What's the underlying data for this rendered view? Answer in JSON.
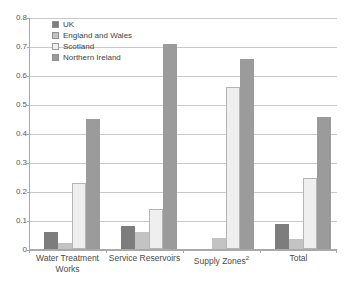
{
  "chart_data": {
    "type": "bar",
    "title": "",
    "subtitle": "",
    "xlabel": "",
    "ylabel": "",
    "ylim": [
      0,
      0.8
    ],
    "ytick_step": 0.1,
    "ytick_labels": [
      "0.8",
      "0.7",
      "0.6",
      "0.5",
      "0.4",
      "0.3",
      "0.2",
      "0.1",
      "0"
    ],
    "ytick_values": [
      0.8,
      0.7,
      0.6,
      0.5,
      0.4,
      0.3,
      0.2,
      0.1,
      0
    ],
    "grid": true,
    "grid_axis": "y",
    "legend_position": "top-left-inside",
    "categories": [
      "Water Treatment Works",
      "Service Reservoirs",
      "Supply Zones",
      "Total"
    ],
    "category_labels": [
      {
        "line1": "Water Treatment",
        "line2": "Works",
        "superscript": ""
      },
      {
        "line1": "Service Reservoirs",
        "line2": "",
        "superscript": ""
      },
      {
        "line1": "Supply Zones",
        "line2": "",
        "superscript": "2"
      },
      {
        "line1": "Total",
        "line2": "",
        "superscript": ""
      }
    ],
    "series": [
      {
        "name": "UK",
        "color": "#7d7d7d",
        "values": [
          0.06,
          0.079,
          0.0,
          0.085
        ]
      },
      {
        "name": "England and Wales",
        "color": "#c3c3c3",
        "values": [
          0.021,
          0.059,
          0.038,
          0.035
        ]
      },
      {
        "name": "Scotland",
        "color": "#efefef",
        "values": [
          0.228,
          0.139,
          0.558,
          0.245
        ]
      },
      {
        "name": "Northern Ireland",
        "color": "#9b9b9b",
        "values": [
          0.449,
          0.706,
          0.656,
          0.456
        ]
      }
    ]
  },
  "legend": {
    "items": [
      {
        "label": "UK"
      },
      {
        "label": "England and Wales"
      },
      {
        "label": "Scotland"
      },
      {
        "label": "Northern Ireland"
      }
    ]
  },
  "colors": {
    "uk": "#7d7d7d",
    "england_and_wales": "#c3c3c3",
    "scotland": "#efefef",
    "northern_ireland": "#9b9b9b",
    "gridline": "#c9c9c9",
    "axis": "#a9a9a9",
    "text": "#4a4a4a",
    "background": "#ffffff"
  }
}
